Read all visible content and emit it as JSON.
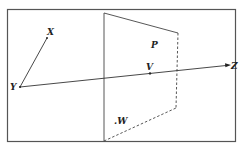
{
  "diagram": {
    "colors": {
      "frame": "#555555",
      "lines": "#333333",
      "labels": "#222222",
      "background": "#ffffff"
    },
    "plane": {
      "label": "P",
      "front_edges": "solid",
      "back_edge": "dashed"
    },
    "points": {
      "X": {
        "label": "X"
      },
      "Y": {
        "label": "Y"
      },
      "Z": {
        "label": "Z"
      },
      "V": {
        "label": "V"
      },
      "W": {
        "label": ".W"
      }
    },
    "segments": [
      {
        "name": "Y-X",
        "from": "Y",
        "to": "X",
        "arrow": "none"
      },
      {
        "name": "Y-Z",
        "from": "Y",
        "to": "Z",
        "arrow": "end",
        "passes_through": "V"
      }
    ]
  }
}
